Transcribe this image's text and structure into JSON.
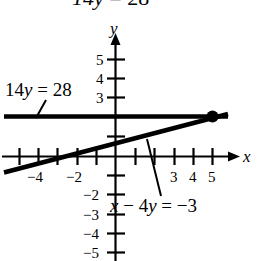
{
  "figure": {
    "type": "coordinate-graph",
    "background": "#ffffff",
    "ink_color": "#000000",
    "top_partial_equation": "14y = 28",
    "axis_labels": {
      "x": "x",
      "y": "y"
    }
  },
  "equations": [
    {
      "id": "horizontal",
      "label": "14y = 28",
      "simplified": "y = 2"
    },
    {
      "id": "slanted",
      "label": "x − 4y = −3",
      "simplified": "y = (x + 3) / 4"
    }
  ],
  "ticks": {
    "x_labeled": [
      "−4",
      "−2",
      "3",
      "4",
      "5"
    ],
    "y_labeled": [
      "5",
      "4",
      "3",
      "−2",
      "−3",
      "−4",
      "−5"
    ]
  },
  "chart_data": {
    "type": "line",
    "title": "",
    "xlabel": "x",
    "ylabel": "y",
    "xlim": [
      -6,
      6
    ],
    "ylim": [
      -6,
      6
    ],
    "grid": false,
    "legend": "inline-annotations",
    "xticks": [
      -5,
      -4,
      -3,
      -2,
      -1,
      1,
      2,
      3,
      4,
      5
    ],
    "xticklabels": [
      "",
      "−4",
      "",
      "−2",
      "",
      "",
      "",
      "3",
      "4",
      "5"
    ],
    "yticks": [
      -5,
      -4,
      -3,
      -2,
      -1,
      1,
      2,
      3,
      4,
      5
    ],
    "yticklabels": [
      "−5",
      "−4",
      "−3",
      "−2",
      "",
      "",
      "",
      "3",
      "4",
      "5"
    ],
    "series": [
      {
        "name": "14y = 28",
        "equation": "y = 2",
        "points": [
          [
            -5.8,
            2
          ],
          [
            5.9,
            2
          ]
        ]
      },
      {
        "name": "x − 4y = −3",
        "equation": "y = (x + 3)/4",
        "points": [
          [
            -5.8,
            -0.7
          ],
          [
            5.9,
            2.225
          ]
        ]
      }
    ],
    "intersection": {
      "x": 5,
      "y": 2,
      "marker": "filled-dot"
    }
  }
}
